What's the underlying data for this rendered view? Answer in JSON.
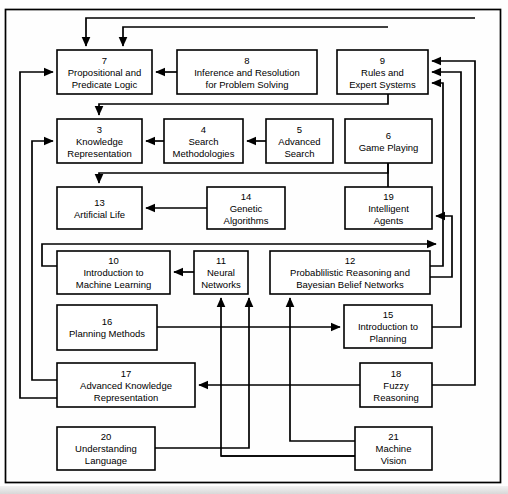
{
  "diagram": {
    "type": "flowchart",
    "background_color": "#ffffff",
    "line_color": "#000000",
    "box_fill": "#ffffff",
    "nodes": [
      {
        "id": "7",
        "number": "7",
        "lines": [
          "Propositional and",
          "Predicate Logic"
        ],
        "x": 57,
        "y": 50,
        "w": 95,
        "h": 44
      },
      {
        "id": "8",
        "number": "8",
        "lines": [
          "Inference and Resolution",
          "for Problem Solving"
        ],
        "x": 177,
        "y": 50,
        "w": 140,
        "h": 44
      },
      {
        "id": "9",
        "number": "9",
        "lines": [
          "Rules and",
          "Expert Systems"
        ],
        "x": 337,
        "y": 50,
        "w": 91,
        "h": 44
      },
      {
        "id": "3",
        "number": "3",
        "lines": [
          "Knowledge",
          "Representation"
        ],
        "x": 57,
        "y": 119,
        "w": 85,
        "h": 44
      },
      {
        "id": "4",
        "number": "4",
        "lines": [
          "Search",
          "Methodologies"
        ],
        "x": 164,
        "y": 119,
        "w": 79,
        "h": 44
      },
      {
        "id": "5",
        "number": "5",
        "lines": [
          "Advanced",
          "Search"
        ],
        "x": 266,
        "y": 119,
        "w": 67,
        "h": 44
      },
      {
        "id": "6",
        "number": "6",
        "lines": [
          "Game Playing"
        ],
        "x": 345,
        "y": 119,
        "w": 87,
        "h": 44
      },
      {
        "id": "13",
        "number": "13",
        "lines": [
          "Artificial Life"
        ],
        "x": 57,
        "y": 187,
        "w": 85,
        "h": 42
      },
      {
        "id": "14",
        "number": "14",
        "lines": [
          "Genetic",
          "Algorithms"
        ],
        "x": 207,
        "y": 187,
        "w": 78,
        "h": 42
      },
      {
        "id": "19",
        "number": "19",
        "lines": [
          "Intelligent",
          "Agents"
        ],
        "x": 345,
        "y": 187,
        "w": 87,
        "h": 42
      },
      {
        "id": "10",
        "number": "10",
        "lines": [
          "Introduction to",
          "Machine Learning"
        ],
        "x": 57,
        "y": 251,
        "w": 113,
        "h": 43
      },
      {
        "id": "11",
        "number": "11",
        "lines": [
          "Neural",
          "Networks"
        ],
        "x": 194,
        "y": 251,
        "w": 54,
        "h": 43
      },
      {
        "id": "12",
        "number": "12",
        "lines": [
          "Probablilistic Reasoning and",
          "Bayesian Belief Networks"
        ],
        "x": 270,
        "y": 251,
        "w": 160,
        "h": 43
      },
      {
        "id": "16",
        "number": "16",
        "lines": [
          "Planning Methods"
        ],
        "x": 57,
        "y": 305,
        "w": 100,
        "h": 45
      },
      {
        "id": "15",
        "number": "15",
        "lines": [
          "Introduction to",
          "Planning"
        ],
        "x": 344,
        "y": 305,
        "w": 88,
        "h": 43
      },
      {
        "id": "17",
        "number": "17",
        "lines": [
          "Advanced Knowledge",
          "Representation"
        ],
        "x": 57,
        "y": 363,
        "w": 138,
        "h": 44
      },
      {
        "id": "18",
        "number": "18",
        "lines": [
          "Fuzzy",
          "Reasoning"
        ],
        "x": 360,
        "y": 363,
        "w": 72,
        "h": 44
      },
      {
        "id": "20",
        "number": "20",
        "lines": [
          "Understanding",
          "Language"
        ],
        "x": 57,
        "y": 427,
        "w": 98,
        "h": 43
      },
      {
        "id": "21",
        "number": "21",
        "lines": [
          "Machine",
          "Vision"
        ],
        "x": 355,
        "y": 427,
        "w": 77,
        "h": 43
      }
    ],
    "edges": [
      {
        "from": "8",
        "to": "7",
        "label": "inference-to-logic"
      },
      {
        "from": "4",
        "to": "3",
        "label": "search-to-knowledge"
      },
      {
        "from": "5",
        "to": "4",
        "label": "advanced-search-to-search"
      },
      {
        "from": "14",
        "to": "13",
        "label": "genetic-to-artificial-life"
      },
      {
        "from": "11",
        "to": "10",
        "label": "neural-to-machine-learning"
      },
      {
        "from": "9",
        "to": "7",
        "label": "rules-to-logic"
      },
      {
        "from": "9",
        "to": "3",
        "label": "rules-to-knowledge"
      },
      {
        "from": "6",
        "to": "3",
        "label": "game-playing-to-knowledge"
      },
      {
        "from": "19",
        "to": "3",
        "label": "agents-to-knowledge"
      },
      {
        "from": "12",
        "to": "9",
        "label": "bayesian-to-rules"
      },
      {
        "from": "15",
        "to": "9",
        "label": "planning-to-rules"
      },
      {
        "from": "18",
        "to": "9",
        "label": "fuzzy-to-rules"
      },
      {
        "from": "12",
        "to": "19",
        "label": "bayesian-to-agents"
      },
      {
        "from": "10",
        "to": "17",
        "label": "machine-learning-to-adv-knowledge"
      },
      {
        "from": "17",
        "to": "7",
        "label": "adv-knowledge-to-logic"
      },
      {
        "from": "17",
        "to": "3",
        "label": "adv-knowledge-to-knowledge"
      },
      {
        "from": "16",
        "to": "15",
        "label": "planning-methods-to-intro-planning"
      },
      {
        "from": "18",
        "to": "17",
        "label": "fuzzy-to-adv-knowledge"
      },
      {
        "from": "20",
        "to": "12",
        "label": "language-to-bayesian"
      },
      {
        "from": "21",
        "to": "12",
        "label": "vision-to-bayesian"
      },
      {
        "from": "21",
        "to": "11",
        "label": "vision-to-neural"
      },
      {
        "from": "21",
        "to": "17",
        "label": "vision-to-adv-knowledge"
      }
    ]
  }
}
